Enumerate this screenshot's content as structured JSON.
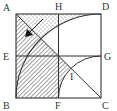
{
  "diagram": {
    "type": "geometry",
    "labels": {
      "A": "A",
      "H": "H",
      "D": "D",
      "E": "E",
      "G": "G",
      "B": "B",
      "F": "F",
      "C": "C",
      "I": "I"
    },
    "shapes": {
      "square": "ABCD",
      "midline_horizontal": "EG",
      "midline_vertical": "HF",
      "diagonal": "AC",
      "large_arc": "BD (center C, radius = side)",
      "small_arc": "FG (center C, radius = half side)",
      "hatched_region": "triangle region below diagonal from A to center plus quadrant EBF and sliver near I",
      "dotted_region": "region above diagonal and large arc near top edge",
      "arrow": "points from dotted region to hatched region"
    },
    "colors": {
      "stroke": "#333333",
      "background": "#ffffff"
    }
  }
}
